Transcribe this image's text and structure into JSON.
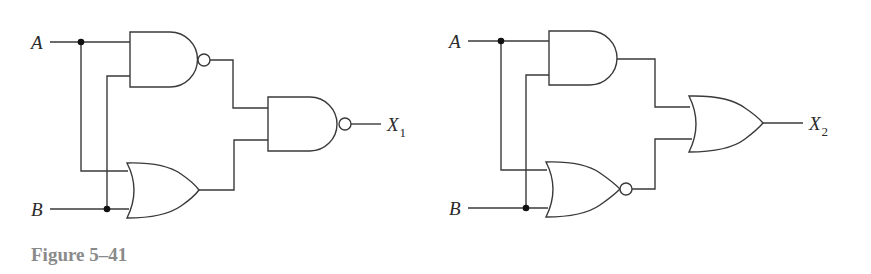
{
  "figure": {
    "caption": "Figure 5–41",
    "circuits": [
      {
        "id": "circuit-1",
        "inputs": [
          "A",
          "B"
        ],
        "output": {
          "symbol": "X",
          "subscript": "1"
        },
        "gates": [
          {
            "type": "NAND",
            "inputs": [
              "A",
              "B"
            ]
          },
          {
            "type": "OR",
            "inputs": [
              "A",
              "B"
            ]
          },
          {
            "type": "NAND",
            "inputs": [
              "NAND(A,B)",
              "OR(A,B)"
            ],
            "output": "X1"
          }
        ]
      },
      {
        "id": "circuit-2",
        "inputs": [
          "A",
          "B"
        ],
        "output": {
          "symbol": "X",
          "subscript": "2"
        },
        "gates": [
          {
            "type": "AND",
            "inputs": [
              "A",
              "B"
            ]
          },
          {
            "type": "NOR",
            "inputs": [
              "A",
              "B"
            ]
          },
          {
            "type": "OR",
            "inputs": [
              "AND(A,B)",
              "NOR(A,B)"
            ],
            "output": "X2"
          }
        ]
      }
    ]
  },
  "labels": {
    "c1": {
      "a": "A",
      "b": "B",
      "out": "X",
      "out_sub": "1"
    },
    "c2": {
      "a": "A",
      "b": "B",
      "out": "X",
      "out_sub": "2"
    }
  },
  "colors": {
    "line": "#3a3a3a",
    "caption": "#8a8a8a",
    "background": "#ffffff"
  }
}
